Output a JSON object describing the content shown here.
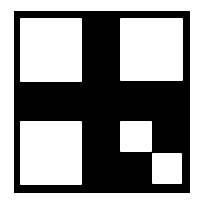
{
  "diagram": {
    "type": "grid-pattern",
    "colors": {
      "background": "#ffffff",
      "frame": "#000000",
      "cell": "#ffffff"
    },
    "frame": {
      "x": 14,
      "y": 11,
      "w": 176,
      "h": 182
    },
    "cells": [
      {
        "name": "top-left",
        "x": 20,
        "y": 18,
        "w": 62,
        "h": 64
      },
      {
        "name": "top-right",
        "x": 120,
        "y": 18,
        "w": 63,
        "h": 63
      },
      {
        "name": "bottom-left",
        "x": 20,
        "y": 121,
        "w": 62,
        "h": 64
      },
      {
        "name": "bottom-right-small-1",
        "x": 120,
        "y": 121,
        "w": 32,
        "h": 31
      },
      {
        "name": "bottom-right-small-2",
        "x": 152,
        "y": 153,
        "w": 30,
        "h": 31
      }
    ]
  }
}
